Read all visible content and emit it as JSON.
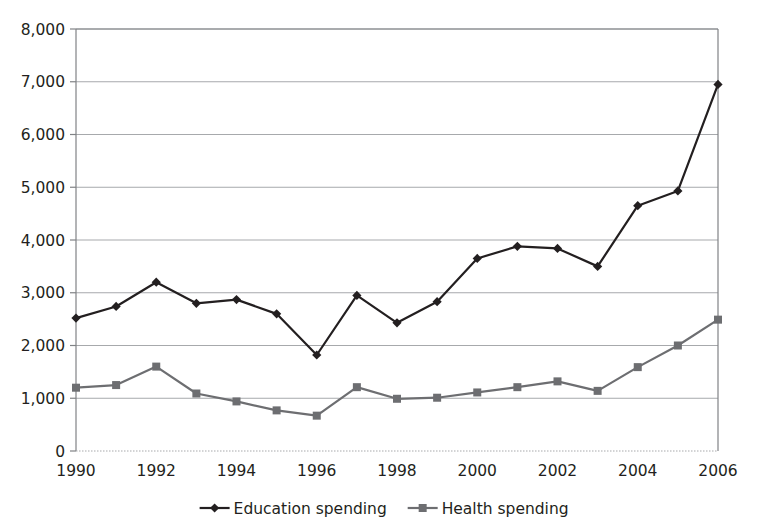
{
  "chart_data": {
    "type": "line",
    "title": "",
    "subtitle": "",
    "xlabel": "",
    "ylabel": "",
    "x": [
      1990,
      1991,
      1992,
      1993,
      1994,
      1995,
      1996,
      1997,
      1998,
      1999,
      2000,
      2001,
      2002,
      2003,
      2004,
      2005,
      2006
    ],
    "xlim": [
      1990,
      2006
    ],
    "ylim": [
      0,
      8000
    ],
    "y_ticks": [
      0,
      1000,
      2000,
      3000,
      4000,
      5000,
      6000,
      7000,
      8000
    ],
    "y_tick_labels": [
      "0",
      "1,000",
      "2,000",
      "3,000",
      "4,000",
      "5,000",
      "6,000",
      "7,000",
      "8,000"
    ],
    "x_ticks": [
      1990,
      1992,
      1994,
      1996,
      1998,
      2000,
      2002,
      2004,
      2006
    ],
    "x_tick_labels": [
      "1990",
      "1992",
      "1994",
      "1996",
      "1998",
      "2000",
      "2002",
      "2004",
      "2006"
    ],
    "grid": {
      "horizontal": true,
      "vertical": false
    },
    "legend_position": "bottom-center",
    "series": [
      {
        "name": "Education spending",
        "color": "#231f20",
        "marker": "diamond",
        "values": [
          2520,
          2740,
          3200,
          2800,
          2870,
          2600,
          1820,
          2950,
          2430,
          2830,
          3650,
          3880,
          3840,
          3500,
          4650,
          4930,
          6950
        ]
      },
      {
        "name": "Health spending",
        "color": "#6d6e71",
        "marker": "square",
        "values": [
          1200,
          1250,
          1600,
          1090,
          940,
          770,
          670,
          1210,
          990,
          1010,
          1110,
          1210,
          1320,
          1140,
          1590,
          2000,
          2490
        ]
      }
    ]
  },
  "legend": {
    "items": [
      {
        "label": "Education spending",
        "color": "#231f20",
        "marker": "diamond"
      },
      {
        "label": "Health spending",
        "color": "#6d6e71",
        "marker": "square"
      }
    ]
  },
  "colors": {
    "education": "#231f20",
    "health": "#6d6e71",
    "grid": "#a7a9ac",
    "axis": "#808285",
    "background": "#ffffff"
  }
}
